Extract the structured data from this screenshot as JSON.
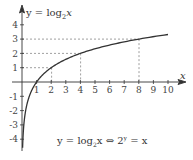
{
  "chart_data": {
    "type": "line",
    "title": "y = log2x",
    "function": "y = log_2(x)",
    "caption": "y = log2x ⇔ 2^y = x",
    "xlabel": "x",
    "ylabel": "y",
    "xlim": [
      0,
      10.5
    ],
    "ylim": [
      -4.5,
      4.5
    ],
    "x_ticks": [
      1,
      2,
      3,
      4,
      5,
      6,
      7,
      8,
      9,
      10
    ],
    "y_ticks": [
      4,
      3,
      2,
      1,
      -1,
      -2,
      -3,
      -4
    ],
    "grid": false,
    "highlighted_points": [
      {
        "x": 2,
        "y": 1
      },
      {
        "x": 4,
        "y": 2
      },
      {
        "x": 8,
        "y": 3
      }
    ],
    "series": [
      {
        "name": "y = log2 x",
        "x": [
          0.0625,
          0.125,
          0.25,
          0.5,
          1,
          2,
          4,
          8,
          10
        ],
        "values": [
          -4,
          -3,
          -2,
          -1,
          0,
          1,
          2,
          3,
          3.32
        ]
      }
    ],
    "legend": "none"
  },
  "labels": {
    "y_axis_title_prefix": "y = log",
    "y_axis_title_sub": "2",
    "y_axis_title_suffix": "x",
    "x_axis_label": "x",
    "caption_left": "y = log",
    "caption_sub": "2",
    "caption_mid": "x ⇔ 2",
    "caption_sup": "y",
    "caption_right": " = x",
    "x_tick_labels": [
      "1",
      "2",
      "3",
      "4",
      "5",
      "6",
      "7",
      "8",
      "9",
      "10"
    ],
    "y_tick_labels": [
      "4",
      "3",
      "2",
      "1",
      "-1",
      "-2",
      "-3",
      "-4"
    ]
  },
  "colors": {
    "curve": "#333333",
    "axes": "#333333",
    "dashes": "#777777",
    "text": "#444444"
  }
}
